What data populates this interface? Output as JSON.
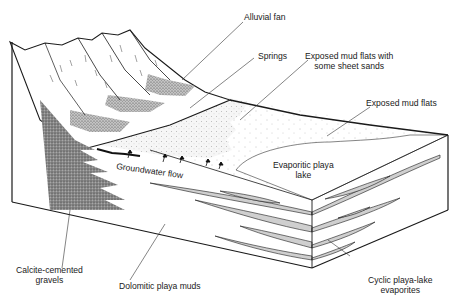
{
  "diagram": {
    "labels": {
      "alluvial_fan": "Alluvial fan",
      "springs": "Springs",
      "exposed_mud_flats_sands_l1": "Exposed mud flats with",
      "exposed_mud_flats_sands_l2": "some sheet sands",
      "exposed_mud_flats": "Exposed mud flats",
      "evaporitic_playa_l1": "Evaporitic playa",
      "evaporitic_playa_l2": "lake",
      "groundwater_flow": "Groundwater flow",
      "calcite_l1": "Calcite-cemented",
      "calcite_l2": "gravels",
      "dolomitic": "Dolomitic playa muds",
      "cyclic_l1": "Cyclic playa-lake",
      "cyclic_l2": "evaporites"
    },
    "colors": {
      "ink": "#1a1a1a",
      "evaporite_fill": "#cfcfcf",
      "gravel_fill": "#6e6e6e",
      "background": "#ffffff"
    }
  }
}
